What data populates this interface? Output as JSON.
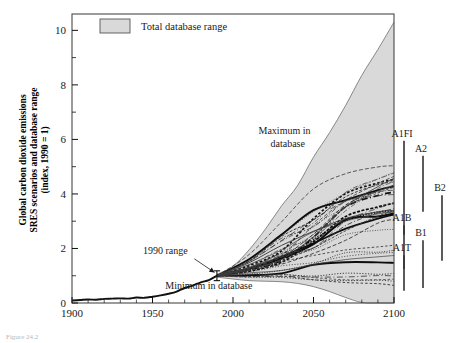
{
  "chart_data": {
    "type": "line",
    "title": "",
    "xlabel": "",
    "ylabel": "Global carbon dioxide emissions SRES scenarios and database range (index, 1990 = 1)",
    "ylabel_line1": "Global carbon dioxide emissions",
    "ylabel_line2": "SRES scenarios and database range",
    "ylabel_line3": "(index, 1990 = 1)",
    "xlim": [
      1900,
      2100
    ],
    "ylim": [
      0,
      10.6
    ],
    "xticks": [
      1900,
      1950,
      2000,
      2050,
      2100
    ],
    "yticks": [
      0,
      2,
      4,
      6,
      8,
      10
    ],
    "yticks_minor": [
      1,
      3,
      5,
      7,
      9
    ],
    "grid": false,
    "legend": {
      "position": "top-left-inside",
      "entries": [
        {
          "label": "Total database range",
          "swatch_color": "#d9d9d9",
          "swatch_border": "#555555"
        }
      ]
    },
    "annotations": [
      {
        "text": "Maximum in",
        "x": 2032,
        "y": 6.2
      },
      {
        "text": "database",
        "x": 2034,
        "y": 5.72
      },
      {
        "text": "1990 range",
        "x": 1958,
        "y": 1.78
      },
      {
        "text": "Minimum in database",
        "x": 1985,
        "y": 0.52
      }
    ],
    "error_bar_1990": {
      "x": 1990,
      "low": 0.82,
      "high": 1.18,
      "center": 1.0
    },
    "historical_series": {
      "name": "Historical CO2 emissions",
      "style": "solid-thick",
      "x": [
        1900,
        1905,
        1910,
        1915,
        1920,
        1925,
        1930,
        1935,
        1940,
        1945,
        1950,
        1955,
        1960,
        1965,
        1970,
        1975,
        1980,
        1985,
        1990
      ],
      "y": [
        0.09,
        0.11,
        0.13,
        0.12,
        0.15,
        0.16,
        0.17,
        0.16,
        0.2,
        0.19,
        0.23,
        0.28,
        0.34,
        0.42,
        0.55,
        0.64,
        0.76,
        0.84,
        1.0
      ]
    },
    "database_range_upper": {
      "name": "Maximum in database",
      "x": [
        1990,
        2000,
        2010,
        2020,
        2030,
        2040,
        2050,
        2060,
        2070,
        2080,
        2090,
        2100
      ],
      "y": [
        1.05,
        1.35,
        1.95,
        2.7,
        3.55,
        4.3,
        5.35,
        6.25,
        7.25,
        8.35,
        9.3,
        10.3
      ]
    },
    "database_range_lower": {
      "name": "Minimum in database",
      "x": [
        1990,
        2000,
        2010,
        2020,
        2030,
        2040,
        2050,
        2060,
        2070,
        2080,
        2090,
        2100
      ],
      "y": [
        0.95,
        0.88,
        0.82,
        0.8,
        0.78,
        0.72,
        0.6,
        0.42,
        0.2,
        0.02,
        -0.18,
        -0.38
      ]
    },
    "sres_scenarios": [
      {
        "name": "A1FI",
        "style": "solid",
        "y2100": 4.85
      },
      {
        "name": "A2",
        "style": "solid",
        "y2100": 4.1
      },
      {
        "name": "A1B",
        "style": "dashed",
        "y2100": 2.8
      },
      {
        "name": "B2",
        "style": "dotted",
        "y2100": 2.25
      },
      {
        "name": "B1",
        "style": "dash-dot",
        "y2100": 1.45
      },
      {
        "name": "A1T",
        "style": "dashed",
        "y2100": 0.85
      }
    ],
    "scenario_markers": [
      {
        "label": "A1FI",
        "low": 2.5,
        "high": 5.95,
        "col": 0
      },
      {
        "label": "A2",
        "low": 3.35,
        "high": 5.4,
        "col": 1
      },
      {
        "label": "B2",
        "low": 1.55,
        "high": 3.95,
        "col": 2
      },
      {
        "label": "A1B",
        "low": 1.25,
        "high": 2.85,
        "col": 0
      },
      {
        "label": "B1",
        "low": 0.55,
        "high": 2.3,
        "col": 1
      },
      {
        "label": "A1T",
        "low": 0.45,
        "high": 1.75,
        "col": 0
      }
    ]
  },
  "caption": {
    "text": "Figure 24.2"
  },
  "colors": {
    "fill_gray": "#d9d9d9",
    "axis": "#4a4a4a",
    "curve_dark": "#111111",
    "text": "#1a1a1a"
  }
}
